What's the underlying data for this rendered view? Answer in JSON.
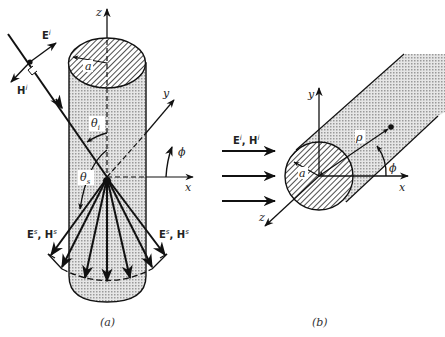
{
  "figure_a": {
    "caption": "(a)",
    "axes": {
      "z": "z",
      "y": "y",
      "x": "x",
      "phi": "ϕ"
    },
    "radius_label": "a",
    "incident": {
      "E": "E",
      "E_sup": "i",
      "H": "H",
      "H_sup": "i"
    },
    "theta_i": {
      "sym": "θ",
      "sub": "i"
    },
    "theta_s": {
      "sym": "θ",
      "sub": "s"
    },
    "scattered_left": {
      "E": "E",
      "E_sup": "s",
      "sep": ", ",
      "H": "H",
      "H_sup": "s"
    },
    "scattered_right": {
      "E": "E",
      "E_sup": "s",
      "sep": ", ",
      "H": "H",
      "H_sup": "s"
    }
  },
  "figure_b": {
    "caption": "(b)",
    "axes": {
      "y": "y",
      "x": "x",
      "z": "z",
      "phi": "ϕ"
    },
    "radius_label": "a",
    "rho_label": "ρ",
    "incident": {
      "E": "E",
      "E_sup": "i",
      "sep": ", ",
      "H": "H",
      "H_sup": "i"
    }
  },
  "colors": {
    "line": "#111111",
    "shade": "#c8c8c8",
    "hatch": "#333333"
  }
}
